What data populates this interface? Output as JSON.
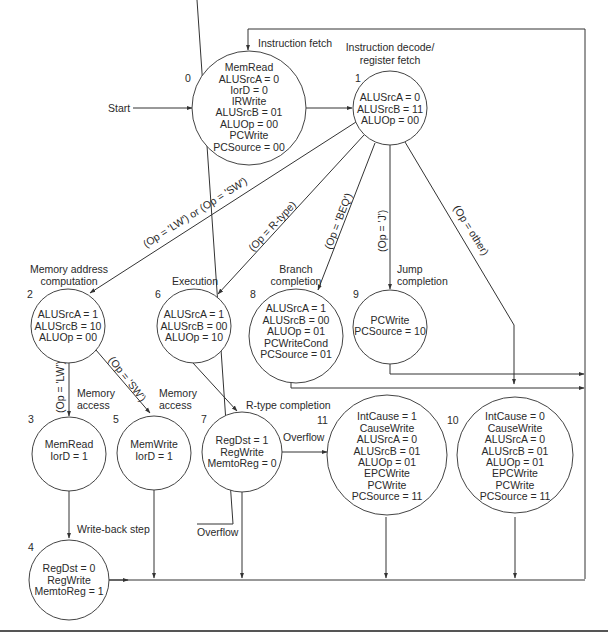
{
  "diagram": {
    "start_label": "Start",
    "states": [
      {
        "id": "0",
        "title": "Instruction fetch",
        "signals": [
          "MemRead",
          "ALUSrcA = 0",
          "IorD = 0",
          "IRWrite",
          "ALUSrcB = 01",
          "ALUOp = 00",
          "PCWrite",
          "PCSource = 00"
        ]
      },
      {
        "id": "1",
        "title": "Instruction decode/ register fetch",
        "title_lines": [
          "Instruction decode/",
          "register fetch"
        ],
        "signals": [
          "ALUSrcA = 0",
          "ALUSrcB = 11",
          "ALUOp = 00"
        ]
      },
      {
        "id": "2",
        "title": "Memory address computation",
        "title_lines": [
          "Memory address",
          "computation"
        ],
        "signals": [
          "ALUSrcA = 1",
          "ALUSrcB = 10",
          "ALUOp = 00"
        ]
      },
      {
        "id": "3",
        "title": "Memory access",
        "title_lines": [
          "Memory",
          "access"
        ],
        "signals": [
          "MemRead",
          "IorD = 1"
        ]
      },
      {
        "id": "4",
        "title": "Write-back step",
        "signals": [
          "RegDst = 0",
          "RegWrite",
          "MemtoReg = 1"
        ]
      },
      {
        "id": "5",
        "title": "Memory access",
        "title_lines": [
          "Memory",
          "access"
        ],
        "signals": [
          "MemWrite",
          "IorD = 1"
        ]
      },
      {
        "id": "6",
        "title": "Execution",
        "signals": [
          "ALUSrcA = 1",
          "ALUSrcB = 00",
          "ALUOp = 10"
        ]
      },
      {
        "id": "7",
        "title": "R-type completion",
        "signals": [
          "RegDst = 1",
          "RegWrite",
          "MemtoReg = 0"
        ]
      },
      {
        "id": "8",
        "title": "Branch completion",
        "title_lines": [
          "Branch",
          "completion"
        ],
        "signals": [
          "ALUSrcA = 1",
          "ALUSrcB = 00",
          "ALUOp = 01",
          "PCWriteCond",
          "PCSource = 01"
        ]
      },
      {
        "id": "9",
        "title": "Jump completion",
        "title_lines": [
          "Jump",
          "completion"
        ],
        "signals": [
          "PCWrite",
          "PCSource = 10"
        ]
      },
      {
        "id": "10",
        "title": "",
        "signals": [
          "IntCause = 0",
          "CauseWrite",
          "ALUSrcA = 0",
          "ALUSrcB = 01",
          "ALUOp = 01",
          "EPCWrite",
          "PCWrite",
          "PCSource = 11"
        ]
      },
      {
        "id": "11",
        "title": "",
        "signals": [
          "IntCause = 1",
          "CauseWrite",
          "ALUSrcA = 0",
          "ALUSrcB = 01",
          "ALUOp = 01",
          "EPCWrite",
          "PCWrite",
          "PCSource = 11"
        ]
      }
    ],
    "transitions": [
      {
        "from": "start",
        "to": "0",
        "label": ""
      },
      {
        "from": "0",
        "to": "1",
        "label": ""
      },
      {
        "from": "1",
        "to": "2",
        "label": "(Op = 'LW') or (Op = 'SW')"
      },
      {
        "from": "1",
        "to": "6",
        "label": "(Op = R-type)"
      },
      {
        "from": "1",
        "to": "8",
        "label": "(Op = 'BEQ')"
      },
      {
        "from": "1",
        "to": "9",
        "label": "(Op = 'J')"
      },
      {
        "from": "1",
        "to": "10",
        "label": "(Op = other)"
      },
      {
        "from": "2",
        "to": "3",
        "label": "(Op = 'LW')"
      },
      {
        "from": "2",
        "to": "5",
        "label": "(Op = 'SW')"
      },
      {
        "from": "3",
        "to": "4",
        "label": ""
      },
      {
        "from": "6",
        "to": "7",
        "label": ""
      },
      {
        "from": "7",
        "to": "11",
        "label": "Overflow"
      },
      {
        "from": "7",
        "to": "0",
        "label": "Overflow (negated)"
      },
      {
        "from": "4",
        "to": "0",
        "label": ""
      },
      {
        "from": "5",
        "to": "0",
        "label": ""
      },
      {
        "from": "8",
        "to": "0",
        "label": ""
      },
      {
        "from": "9",
        "to": "0",
        "label": ""
      },
      {
        "from": "10",
        "to": "0",
        "label": ""
      },
      {
        "from": "11",
        "to": "0",
        "label": ""
      }
    ],
    "edge_labels": {
      "lw_or_sw": "(Op = 'LW') or (Op = 'SW')",
      "rtype": "(Op = R-type)",
      "beq": "(Op = 'BEQ')",
      "j": "(Op = 'J')",
      "other": "(Op = other)",
      "lw": "(Op = 'LW')",
      "sw": "(Op = 'SW')",
      "overflow": "Overflow",
      "not_overflow": "Overflow"
    }
  }
}
